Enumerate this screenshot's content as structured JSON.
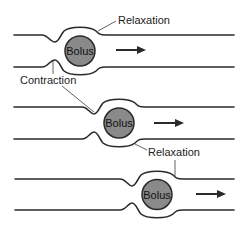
{
  "diagram": {
    "title": "",
    "colors": {
      "background": "#ffffff",
      "wall": "#2a2a2a",
      "bolus_fill": "#8a8a8a"
    },
    "panels": [
      {
        "bolus_label": "Bolus",
        "direction_arrow": "right-arrow-icon",
        "labels": {
          "relaxation": "Relaxation",
          "contraction": "Contraction"
        }
      },
      {
        "bolus_label": "Bolus",
        "direction_arrow": "right-arrow-icon",
        "labels": {
          "relaxation": "Relaxation"
        }
      },
      {
        "bolus_label": "Bolus",
        "direction_arrow": "right-arrow-icon",
        "labels": {}
      }
    ]
  }
}
